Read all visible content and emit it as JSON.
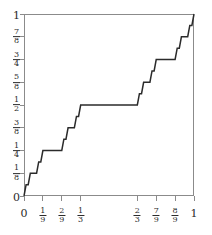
{
  "figure": {
    "kind": "cantor-function-plot",
    "background_color": "#ffffff",
    "frame_color": "#8b8b8b",
    "curve_color": "#2b2b2b"
  },
  "chart_data": {
    "type": "line",
    "title": "",
    "xlabel": "",
    "ylabel": "",
    "xlim": [
      0,
      1
    ],
    "ylim": [
      0,
      1
    ],
    "grid": false,
    "legend": null,
    "xticks": [
      0,
      0.1111111111,
      0.2222222222,
      0.3333333333,
      0.6666666667,
      0.7777777778,
      0.8888888889,
      1
    ],
    "xticklabels": [
      "0",
      "1/9",
      "2/9",
      "1/3",
      "2/3",
      "7/9",
      "8/9",
      "1"
    ],
    "xticklabels_display": [
      {
        "type": "int",
        "text": "0"
      },
      {
        "type": "frac",
        "num": "1",
        "den": "9"
      },
      {
        "type": "frac",
        "num": "2",
        "den": "9"
      },
      {
        "type": "frac",
        "num": "1",
        "den": "3"
      },
      {
        "type": "frac",
        "num": "2",
        "den": "3"
      },
      {
        "type": "frac",
        "num": "7",
        "den": "9"
      },
      {
        "type": "frac",
        "num": "8",
        "den": "9"
      },
      {
        "type": "int",
        "text": "1"
      }
    ],
    "yticks": [
      0,
      0.125,
      0.25,
      0.375,
      0.5,
      0.625,
      0.75,
      0.875,
      1
    ],
    "yticklabels": [
      "0",
      "1/8",
      "1/4",
      "3/8",
      "1/2",
      "5/8",
      "3/4",
      "7/8",
      "1"
    ],
    "yticklabels_display": [
      {
        "type": "int",
        "text": "0"
      },
      {
        "type": "frac",
        "num": "1",
        "den": "8"
      },
      {
        "type": "frac",
        "num": "1",
        "den": "4"
      },
      {
        "type": "frac",
        "num": "3",
        "den": "8"
      },
      {
        "type": "frac",
        "num": "1",
        "den": "2"
      },
      {
        "type": "frac",
        "num": "5",
        "den": "8"
      },
      {
        "type": "frac",
        "num": "3",
        "den": "4"
      },
      {
        "type": "frac",
        "num": "7",
        "den": "8"
      },
      {
        "type": "int",
        "text": "1"
      }
    ],
    "series": [
      {
        "name": "Cantor function",
        "x": [
          0.0,
          0.012345679,
          0.024691358,
          0.037037037,
          0.074074074,
          0.086419753,
          0.098765432,
          0.111111111,
          0.222222222,
          0.234567901,
          0.24691358,
          0.259259259,
          0.296296296,
          0.308641975,
          0.320987654,
          0.333333333,
          0.666666667,
          0.679012346,
          0.691358025,
          0.703703704,
          0.740740741,
          0.75308642,
          0.765432099,
          0.777777778,
          0.888888889,
          0.901234568,
          0.913580247,
          0.925925926,
          0.962962963,
          0.975308642,
          0.987654321,
          1.0
        ],
        "y": [
          0.0,
          0.0625,
          0.0625,
          0.125,
          0.125,
          0.1875,
          0.1875,
          0.25,
          0.25,
          0.3125,
          0.3125,
          0.375,
          0.375,
          0.4375,
          0.4375,
          0.5,
          0.5,
          0.5625,
          0.5625,
          0.625,
          0.625,
          0.6875,
          0.6875,
          0.75,
          0.75,
          0.8125,
          0.8125,
          0.875,
          0.875,
          0.9375,
          0.9375,
          1.0
        ]
      }
    ],
    "plateaus": [
      {
        "x_range": [
          0.037037037,
          0.074074074
        ],
        "y": 0.125
      },
      {
        "x_range": [
          0.111111111,
          0.222222222
        ],
        "y": 0.25
      },
      {
        "x_range": [
          0.259259259,
          0.296296296
        ],
        "y": 0.375
      },
      {
        "x_range": [
          0.333333333,
          0.666666667
        ],
        "y": 0.5
      },
      {
        "x_range": [
          0.703703704,
          0.740740741
        ],
        "y": 0.625
      },
      {
        "x_range": [
          0.777777778,
          0.888888889
        ],
        "y": 0.75
      },
      {
        "x_range": [
          0.925925926,
          0.962962963
        ],
        "y": 0.875
      }
    ]
  }
}
